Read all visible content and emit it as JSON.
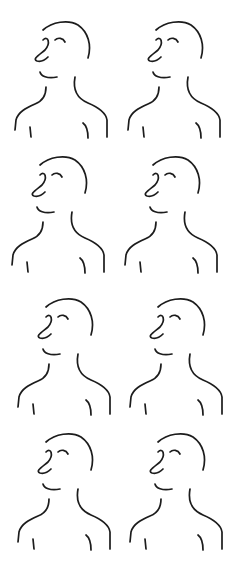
{
  "sheet": {
    "title": "Line drawings of a bald figure in profile",
    "background": "#ffffff",
    "stroke_color": "#1c1c1c",
    "layout": {
      "rows": 4,
      "columns": 2
    }
  },
  "figures": [
    {
      "row": 1,
      "column": 1,
      "label": "figure-1"
    },
    {
      "row": 1,
      "column": 2,
      "label": "figure-2"
    },
    {
      "row": 2,
      "column": 1,
      "label": "figure-3"
    },
    {
      "row": 2,
      "column": 2,
      "label": "figure-4"
    },
    {
      "row": 3,
      "column": 1,
      "label": "figure-5"
    },
    {
      "row": 3,
      "column": 2,
      "label": "figure-6"
    },
    {
      "row": 4,
      "column": 1,
      "label": "figure-7"
    },
    {
      "row": 4,
      "column": 2,
      "label": "figure-8"
    }
  ]
}
